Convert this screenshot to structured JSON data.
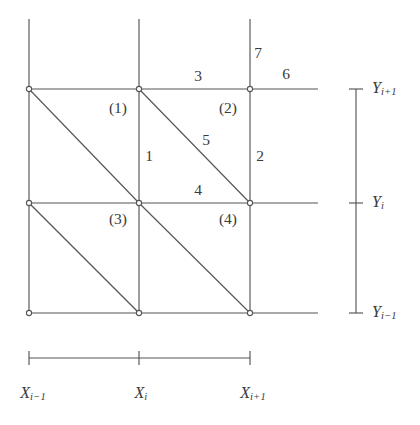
{
  "figure": {
    "type": "finite-element-mesh-diagram",
    "background_color": "#ffffff",
    "line_color": "#555555",
    "text_color": "#3a3a3a",
    "node_marker": "open-circle"
  },
  "grid": {
    "x_positions": [
      29,
      139,
      250
    ],
    "y_positions": [
      89,
      203,
      313
    ],
    "x_names": [
      "X_{i-1}",
      "X_i",
      "X_{i+1}"
    ],
    "y_names": [
      "Y_{i-1}",
      "Y_i",
      "Y_{i+1}"
    ],
    "horizontal_line_right_end": 318,
    "vertical_line_top_end": 19
  },
  "nodes": [
    {
      "id": "n-top-left",
      "x": 29,
      "y": 89
    },
    {
      "id": "n-top-mid",
      "x": 139,
      "y": 89
    },
    {
      "id": "n-top-right",
      "x": 250,
      "y": 89
    },
    {
      "id": "n-mid-left",
      "x": 29,
      "y": 203
    },
    {
      "id": "n-center",
      "x": 139,
      "y": 203
    },
    {
      "id": "n-mid-right",
      "x": 250,
      "y": 203
    },
    {
      "id": "n-bottom-left",
      "x": 29,
      "y": 313
    },
    {
      "id": "n-bottom-mid",
      "x": 139,
      "y": 313
    },
    {
      "id": "n-bottom-right",
      "x": 250,
      "y": 313
    }
  ],
  "diagonals": [
    {
      "id": "diag-cell-top-left",
      "x1": 29,
      "y1": 89,
      "x2": 139,
      "y2": 203
    },
    {
      "id": "diag-cell-top-right",
      "x1": 139,
      "y1": 89,
      "x2": 250,
      "y2": 203
    },
    {
      "id": "diag-cell-bottom-left",
      "x1": 29,
      "y1": 203,
      "x2": 139,
      "y2": 313
    },
    {
      "id": "diag-cell-bottom-right",
      "x1": 139,
      "y1": 203,
      "x2": 250,
      "y2": 313
    }
  ],
  "cell_labels": [
    {
      "id": "cell-1",
      "text": "(1)",
      "x": 118,
      "y": 108
    },
    {
      "id": "cell-2",
      "text": "(2)",
      "x": 228,
      "y": 108
    },
    {
      "id": "cell-3",
      "text": "(3)",
      "x": 118,
      "y": 219
    },
    {
      "id": "cell-4",
      "text": "(4)",
      "x": 228,
      "y": 219
    }
  ],
  "edge_labels": [
    {
      "id": "edge-1",
      "text": "1",
      "x": 149,
      "y": 156
    },
    {
      "id": "edge-2",
      "text": "2",
      "x": 260,
      "y": 156
    },
    {
      "id": "edge-3",
      "text": "3",
      "x": 198,
      "y": 76
    },
    {
      "id": "edge-4",
      "text": "4",
      "x": 198,
      "y": 190
    },
    {
      "id": "edge-5",
      "text": "5",
      "x": 206,
      "y": 140
    },
    {
      "id": "edge-6",
      "text": "6",
      "x": 286,
      "y": 74
    },
    {
      "id": "edge-7",
      "text": "7",
      "x": 258,
      "y": 53
    }
  ],
  "y_axis": {
    "ruler_x": 356,
    "top": 89,
    "bottom": 313,
    "tick_half_width": 7,
    "ticks": [
      {
        "id": "y-tick-top",
        "y": 89,
        "var": "Y",
        "sub": "i+1",
        "label_x": 372
      },
      {
        "id": "y-tick-middle",
        "y": 203,
        "var": "Y",
        "sub": "i",
        "label_x": 372
      },
      {
        "id": "y-tick-bottom",
        "y": 313,
        "var": "Y",
        "sub": "i−1",
        "label_x": 372
      }
    ]
  },
  "x_axis": {
    "ruler_y": 358,
    "left": 29,
    "right": 250,
    "tick_half_height": 7,
    "ticks": [
      {
        "id": "x-tick-left",
        "x": 29,
        "var": "X",
        "sub": "i−1",
        "label_x": 33,
        "label_y": 385
      },
      {
        "id": "x-tick-middle",
        "x": 139,
        "var": "X",
        "sub": "i",
        "label_x": 141,
        "label_y": 385
      },
      {
        "id": "x-tick-right",
        "x": 250,
        "var": "X",
        "sub": "i+1",
        "label_x": 253,
        "label_y": 385
      }
    ]
  }
}
